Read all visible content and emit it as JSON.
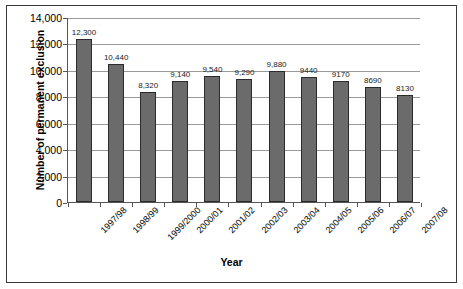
{
  "chart_data": {
    "type": "bar",
    "title": "",
    "xlabel": "Year",
    "ylabel": "Number of permanent exclusion",
    "categories": [
      "1997/98",
      "1998/99",
      "1999/2000",
      "2000/01",
      "2001/02",
      "2002/03",
      "2003/04",
      "2004/05",
      "2005/06",
      "2006/07",
      "2007/08"
    ],
    "values": [
      12300,
      10440,
      8320,
      9140,
      9540,
      9290,
      9880,
      9440,
      9170,
      8690,
      8130
    ],
    "data_labels": [
      "12,300",
      "10,440",
      "8,320",
      "9,140",
      "9,540",
      "9,290",
      "9,880",
      "9440",
      "9170",
      "8690",
      "8130"
    ],
    "ylim": [
      0,
      14000
    ],
    "yticks": [
      0,
      2000,
      4000,
      6000,
      8000,
      10000,
      12000,
      14000
    ],
    "ytick_labels": [
      "0",
      "2,000",
      "4,000",
      "6,000",
      "8,000",
      "10,000",
      "12,000",
      "14,000"
    ],
    "grid": true,
    "legend": false,
    "bar_color": "#6b6b6b",
    "bar_border_color": "#2b2b2b",
    "gridline_color": "#9a9a9a",
    "axis_color": "#555555",
    "frame_color": "#3a3a3a"
  }
}
